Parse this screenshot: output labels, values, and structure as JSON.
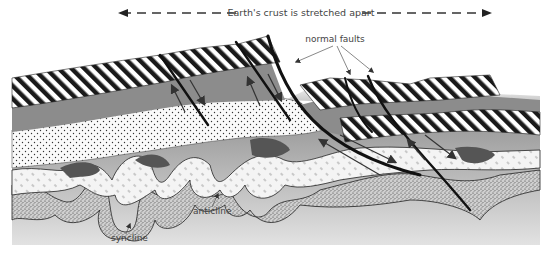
{
  "diagram": {
    "type": "geological cross-section",
    "title_arrow_label": "Earth's crust is stretched apart",
    "labels": {
      "normal_faults": "normal faults",
      "anticline": "anticline",
      "syncline": "syncline"
    },
    "colors": {
      "background": "#ffffff",
      "base_gray": "#a8a8a8",
      "mid_gray": "#8c8c8c",
      "dark_gray": "#555555",
      "stripe_dark": "#1a1a1a",
      "text": "#444444"
    }
  }
}
